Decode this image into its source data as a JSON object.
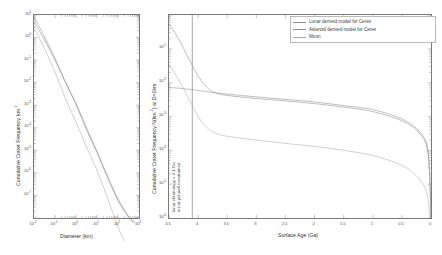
{
  "figure": {
    "panels": [
      {
        "id": "left",
        "xlabel": "Diameter (km)",
        "ylabel_main": "Cumulative Crater Frequency, km",
        "ylabel_sup": "-2",
        "xticks": [
          "10",
          "10",
          "10",
          "10",
          "10",
          "10"
        ],
        "xtick_sups": [
          "-2",
          "-1",
          "0",
          "1",
          "2",
          "3"
        ],
        "yticks": [
          "10",
          "10",
          "10",
          "10",
          "10",
          "10",
          "10",
          "10",
          "10"
        ],
        "ytick_sups": [
          "1",
          "0",
          "-1",
          "-2",
          "-3",
          "-4",
          "-5",
          "-6",
          "-7"
        ]
      },
      {
        "id": "right",
        "xlabel": "Surface Age (Ga)",
        "ylabel_main": "Cumulative Crater Frequency N(km",
        "ylabel_sup": "-2",
        "ylabel_tail": ") at D=1km",
        "xticks": [
          "4.5",
          "4",
          "3.5",
          "3",
          "2.5",
          "2",
          "1.5",
          "1",
          "0.5",
          "0"
        ],
        "yticks": [
          "10",
          "10",
          "10",
          "10",
          "10",
          "10"
        ],
        "ytick_sups": [
          "-1",
          "-2",
          "-3",
          "-4",
          "-5",
          "-6"
        ],
        "annotation_line1": "lunar chronology > 4.1 Ga",
        "annotation_line2": "is not yet well constrained"
      }
    ],
    "legend": {
      "items": [
        {
          "label": "Lunar derived model for Ceres",
          "color": "#8a8a8a"
        },
        {
          "label": "Asteroid derived model for Ceres",
          "color": "#8a8a8a"
        },
        {
          "label": "Moon",
          "color": "#a8a8a8"
        }
      ]
    }
  },
  "chart_data": [
    {
      "type": "line",
      "panel": "left",
      "title": "",
      "xlabel": "Diameter (km)",
      "ylabel": "Cumulative Crater Frequency, km^-2",
      "xscale": "log",
      "yscale": "log",
      "xlim": [
        0.01,
        1000
      ],
      "ylim": [
        1e-08,
        10
      ],
      "grid": false,
      "series": [
        {
          "name": "Lunar derived model for Ceres",
          "color": "#8a8a8a",
          "x": [
            0.01,
            0.03,
            0.1,
            0.3,
            1,
            3,
            10,
            30,
            100,
            300,
            600
          ],
          "y": [
            8.0,
            1.2,
            0.12,
            0.012,
            0.0011,
            9e-05,
            8e-06,
            7e-07,
            6e-08,
            1.2e-08,
            6e-09
          ]
        },
        {
          "name": "Asteroid derived model for Ceres",
          "color": "#8a8a8a",
          "x": [
            0.01,
            0.03,
            0.1,
            0.3,
            1,
            3,
            10,
            30,
            100,
            300,
            600
          ],
          "y": [
            5.0,
            0.85,
            0.1,
            0.011,
            0.0012,
            0.00011,
            9e-06,
            8e-07,
            7e-08,
            1.3e-08,
            6.5e-09
          ]
        },
        {
          "name": "Moon",
          "color": "#a8a8a8",
          "x": [
            0.01,
            0.03,
            0.1,
            0.3,
            1,
            3,
            10,
            30,
            100,
            200
          ],
          "y": [
            3.0,
            0.35,
            0.03,
            0.0022,
            0.00018,
            1.6e-05,
            1.3e-06,
            9e-08,
            4e-09,
            1e-09
          ]
        }
      ]
    },
    {
      "type": "line",
      "panel": "right",
      "title": "",
      "xlabel": "Surface Age (Ga)",
      "ylabel": "Cumulative Crater Frequency N(km^-2) at D=1km",
      "xscale": "linear",
      "yscale": "log",
      "xlim": [
        4.5,
        0
      ],
      "ylim": [
        1e-06,
        1
      ],
      "x_reversed": true,
      "grid": false,
      "reference_line": {
        "x": 4.1,
        "label": "lunar chronology > 4.1 Ga is not yet well constrained"
      },
      "series": [
        {
          "name": "Lunar derived model for Ceres",
          "color": "#8a8a8a",
          "x": [
            4.5,
            4.4,
            4.3,
            4.2,
            4.1,
            4.0,
            3.9,
            3.8,
            3.7,
            3.5,
            3.0,
            2.5,
            2.0,
            1.5,
            1.0,
            0.5,
            0.2,
            0.05,
            0.0
          ],
          "y": [
            0.55,
            0.3,
            0.15,
            0.07,
            0.032,
            0.016,
            0.009,
            0.0062,
            0.005,
            0.0042,
            0.0034,
            0.0029,
            0.0024,
            0.0019,
            0.0014,
            0.00075,
            0.00032,
            8e-05,
            1e-06
          ]
        },
        {
          "name": "Asteroid derived model for Ceres",
          "color": "#8a8a8a",
          "x": [
            4.5,
            4.3,
            4.1,
            4.0,
            3.9,
            3.7,
            3.5,
            3.0,
            2.5,
            2.0,
            1.5,
            1.0,
            0.5,
            0.2,
            0.05,
            0.0
          ],
          "y": [
            0.0072,
            0.0068,
            0.0062,
            0.0059,
            0.0056,
            0.005,
            0.0046,
            0.0038,
            0.0032,
            0.0027,
            0.0021,
            0.0016,
            0.00085,
            0.00036,
            9e-05,
            1e-06
          ]
        },
        {
          "name": "Moon",
          "color": "#a8a8a8",
          "x": [
            4.5,
            4.4,
            4.3,
            4.2,
            4.1,
            4.0,
            3.9,
            3.8,
            3.7,
            3.5,
            3.0,
            2.5,
            2.0,
            1.5,
            1.0,
            0.5,
            0.2,
            0.05,
            0.0
          ],
          "y": [
            0.035,
            0.019,
            0.0095,
            0.0046,
            0.0021,
            0.001,
            0.00058,
            0.0004,
            0.00032,
            0.00026,
            0.0002,
            0.00016,
            0.00013,
            0.0001,
            7e-05,
            3.6e-05,
            1.4e-05,
            3.5e-06,
            1e-07
          ]
        }
      ]
    }
  ]
}
